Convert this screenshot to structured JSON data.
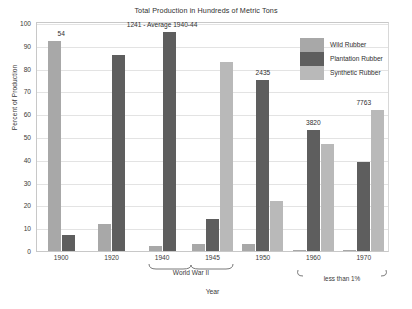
{
  "chart_data": {
    "type": "bar",
    "title": "Total Production in Hundreds of Metric Tons",
    "xlabel": "Year",
    "ylabel": "Percent of Production",
    "categories": [
      "1900",
      "1920",
      "1940",
      "1945",
      "1950",
      "1960",
      "1970"
    ],
    "ylim": [
      0,
      100
    ],
    "yticks": [
      "0",
      "10",
      "20",
      "30",
      "40",
      "50",
      "60",
      "70",
      "80",
      "90",
      "100"
    ],
    "grid": true,
    "legend_position": "top-right",
    "series": [
      {
        "name": "Wild Rubber",
        "color": "#a8a8a8",
        "values": [
          92,
          12,
          2,
          3,
          3,
          0.5,
          0.5
        ]
      },
      {
        "name": "Plantation Rubber",
        "color": "#5e5e5e",
        "values": [
          7,
          86,
          96,
          14,
          75,
          53,
          39
        ]
      },
      {
        "name": "Synthetic Rubber",
        "color": "#b9b9b9",
        "values": [
          0,
          0,
          0,
          83,
          22,
          47,
          62
        ]
      }
    ],
    "data_labels": [
      {
        "category": "1900",
        "text": "54"
      },
      {
        "category": "1940",
        "text": "1241 - Average 1940-44"
      },
      {
        "category": "1950",
        "text": "2435"
      },
      {
        "category": "1960",
        "text": "3820"
      },
      {
        "category": "1970",
        "text": "7763"
      }
    ],
    "annotations": [
      {
        "name": "world-war-two",
        "text": "World War II",
        "spans": [
          "1940",
          "1945"
        ]
      },
      {
        "name": "less-than-one-percent",
        "text": "less than 1%",
        "spans": [
          "1960",
          "1970"
        ]
      }
    ]
  },
  "legend": {
    "items": [
      {
        "label": "Wild Rubber",
        "color": "#a8a8a8"
      },
      {
        "label": "Plantation Rubber",
        "color": "#5e5e5e"
      },
      {
        "label": "Synthetic Rubber",
        "color": "#b9b9b9"
      }
    ]
  }
}
